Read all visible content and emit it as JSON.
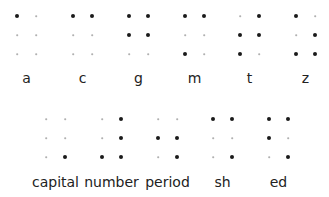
{
  "diagram": {
    "dot_color": "#1a1a1a",
    "empty_dot_color": "#b0b0b0",
    "rows": [
      {
        "cells": [
          {
            "label": "a",
            "dots": [
              1,
              0,
              0,
              0,
              0,
              0
            ]
          },
          {
            "label": "c",
            "dots": [
              1,
              1,
              0,
              0,
              0,
              0
            ]
          },
          {
            "label": "g",
            "dots": [
              1,
              1,
              1,
              1,
              0,
              0
            ]
          },
          {
            "label": "m",
            "dots": [
              1,
              1,
              0,
              0,
              1,
              0
            ]
          },
          {
            "label": "t",
            "dots": [
              0,
              1,
              1,
              1,
              1,
              0
            ]
          },
          {
            "label": "z",
            "dots": [
              1,
              0,
              0,
              1,
              1,
              1
            ]
          }
        ]
      },
      {
        "cells": [
          {
            "label": "capital",
            "dots": [
              0,
              0,
              0,
              0,
              0,
              1
            ]
          },
          {
            "label": "number",
            "dots": [
              0,
              1,
              0,
              1,
              1,
              1
            ]
          },
          {
            "label": "period",
            "dots": [
              0,
              0,
              1,
              1,
              0,
              1
            ]
          },
          {
            "label": "sh",
            "dots": [
              1,
              1,
              0,
              0,
              0,
              1
            ]
          },
          {
            "label": "ed",
            "dots": [
              1,
              1,
              1,
              0,
              0,
              1
            ]
          }
        ]
      }
    ]
  }
}
